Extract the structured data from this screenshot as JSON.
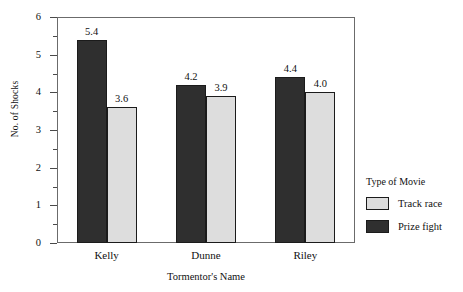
{
  "chart_data": {
    "type": "bar",
    "title": "",
    "xlabel": "Tormentor's Name",
    "ylabel": "No. of Shocks",
    "categories": [
      "Kelly",
      "Dunne",
      "Riley"
    ],
    "series": [
      {
        "name": "Prize fight",
        "values": [
          5.4,
          4.2,
          4.4
        ],
        "color": "#2f2f2f"
      },
      {
        "name": "Track race",
        "values": [
          3.6,
          3.9,
          4.0
        ],
        "color": "#dddddd"
      }
    ],
    "value_labels": [
      [
        "5.4",
        "3.6"
      ],
      [
        "4.2",
        "3.9"
      ],
      [
        "4.4",
        "4.0"
      ]
    ],
    "ylim": [
      0,
      6
    ],
    "ytick_labels": [
      "0",
      "1",
      "2",
      "3",
      "4",
      "5",
      "6"
    ],
    "ytick_values": [
      0,
      1,
      2,
      3,
      4,
      5,
      6
    ],
    "yminor_values": [
      0.5,
      1.5,
      2.5,
      3.5,
      4.5,
      5.5
    ],
    "grid": false,
    "legend": {
      "position": "right",
      "title": "Type of Movie",
      "entries": [
        {
          "label": "Track race",
          "swatch": "light"
        },
        {
          "label": "Prize fight",
          "swatch": "dark"
        }
      ]
    },
    "frame": true,
    "bar_order_in_group": [
      "Prize fight",
      "Track race"
    ]
  }
}
